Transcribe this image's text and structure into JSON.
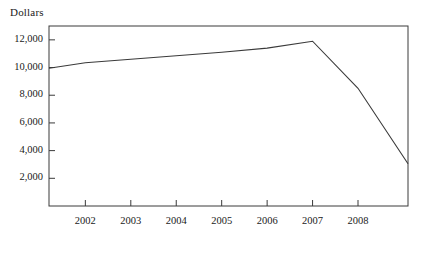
{
  "chart_data": {
    "type": "line",
    "title": "",
    "ylabel": "Dollars",
    "xlabel": "",
    "ylim": [
      0,
      13000
    ],
    "xlim": [
      2001.2,
      2009.1
    ],
    "grid": false,
    "legend": null,
    "y_ticks": [
      2000,
      4000,
      6000,
      8000,
      10000,
      12000
    ],
    "y_tick_labels": [
      "2,000",
      "4,000",
      "6,000",
      "8,000",
      "10,000",
      "12,000"
    ],
    "x_ticks": [
      2002,
      2003,
      2004,
      2005,
      2006,
      2007,
      2008
    ],
    "x_tick_labels": [
      "2002",
      "2003",
      "2004",
      "2005",
      "2006",
      "2007",
      "2008"
    ],
    "series": [
      {
        "name": "Dollars",
        "color": "#3a3a3a",
        "x": [
          2001.2,
          2002,
          2003,
          2004,
          2005,
          2006,
          2007,
          2008,
          2009.1
        ],
        "values": [
          9950,
          10350,
          10600,
          10850,
          11100,
          11400,
          11900,
          8500,
          3050
        ]
      }
    ]
  },
  "axis": {
    "title": "Dollars",
    "line_color": "#3a3a3a"
  }
}
